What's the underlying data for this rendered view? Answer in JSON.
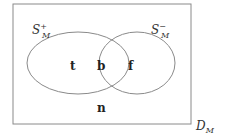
{
  "diagram": {
    "type": "venn",
    "universe": {
      "label_base": "D",
      "label_sub": "M"
    },
    "sets": [
      {
        "id": "positive",
        "label_base": "S",
        "label_sup": "+",
        "label_sub": "M"
      },
      {
        "id": "negative",
        "label_base": "S",
        "label_sup": "−",
        "label_sub": "M"
      }
    ],
    "regions": {
      "left_only": "t",
      "intersection": "b",
      "right_only": "f",
      "outside": "n"
    },
    "colors": {
      "stroke": "#8a8a8a",
      "text": "#222222"
    }
  }
}
